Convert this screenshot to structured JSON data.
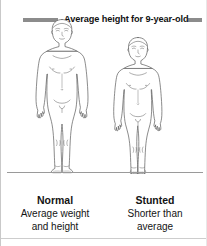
{
  "diagram": {
    "reference_line": {
      "label": "Average height for 9-year-old",
      "color": "#8c8c8c"
    },
    "ground_line": {
      "color": "#9a9a9a"
    },
    "figures": [
      {
        "id": "normal",
        "title": "Normal",
        "description_line1": "Average weight",
        "description_line2": "and height",
        "outline_color": "#5a5a5a",
        "fill_color": "#ffffff"
      },
      {
        "id": "stunted",
        "title": "Stunted",
        "description_line1": "Shorter than",
        "description_line2": "average",
        "outline_color": "#5a5a5a",
        "fill_color": "#ffffff"
      }
    ]
  }
}
